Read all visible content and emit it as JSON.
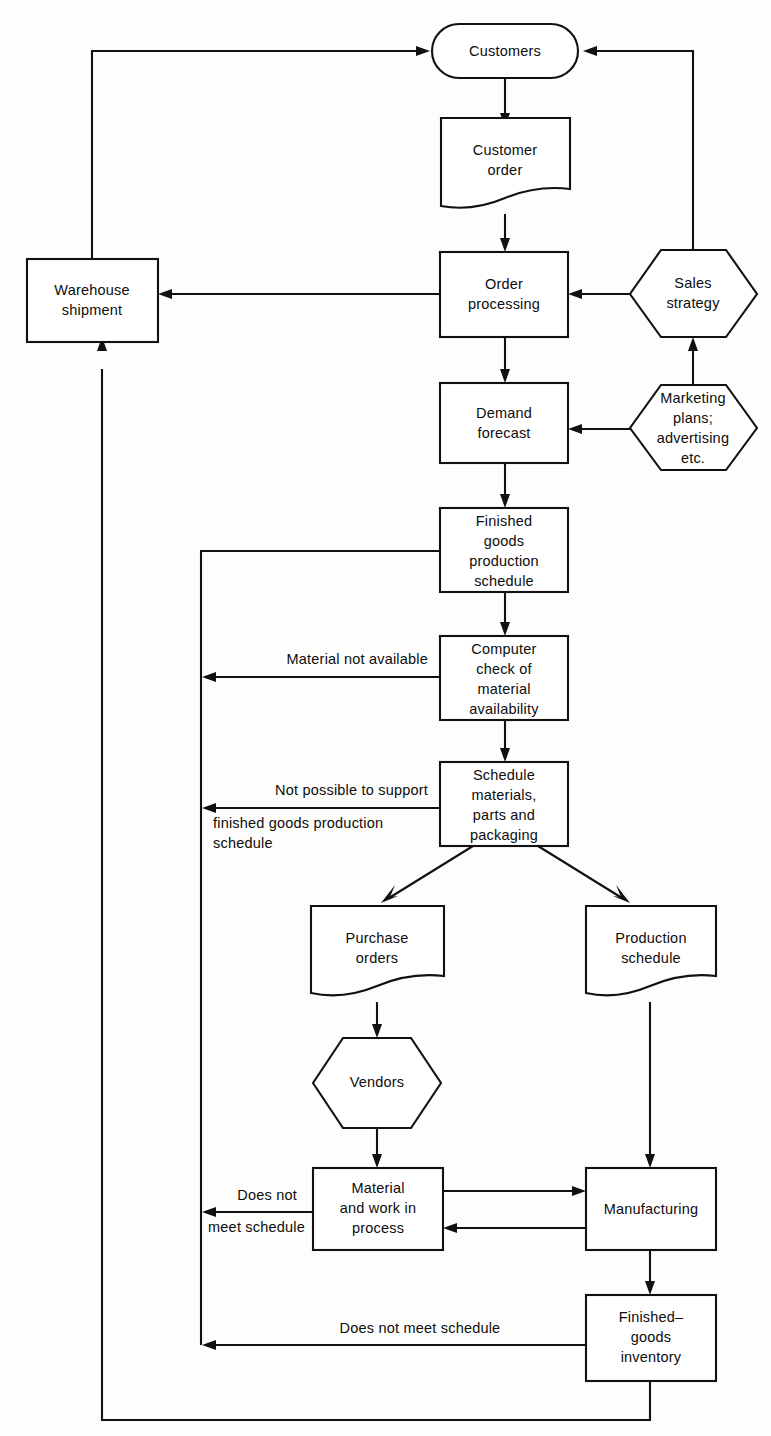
{
  "diagram": {
    "background_color": "#fdfdfb",
    "line_color": "#111111",
    "shape_fill": "#ffffff"
  },
  "nodes": {
    "customers": {
      "label": "Customers",
      "shape": "stadium"
    },
    "customer_order": {
      "label_line1": "Customer",
      "label_line2": "order",
      "shape": "document"
    },
    "order_processing": {
      "label_line1": "Order",
      "label_line2": "processing",
      "shape": "rect"
    },
    "sales_strategy": {
      "label_line1": "Sales",
      "label_line2": "strategy",
      "shape": "hexagon"
    },
    "warehouse_shipment": {
      "label_line1": "Warehouse",
      "label_line2": "shipment",
      "shape": "rect"
    },
    "demand_forecast": {
      "label_line1": "Demand",
      "label_line2": "forecast",
      "shape": "rect"
    },
    "marketing_plans": {
      "label_line1": "Marketing",
      "label_line2": "plans;",
      "label_line3": "advertising",
      "label_line4": "etc.",
      "shape": "hexagon"
    },
    "finished_goods_production_schedule": {
      "label_line1": "Finished",
      "label_line2": "goods",
      "label_line3": "production",
      "label_line4": "schedule",
      "shape": "rect"
    },
    "computer_check": {
      "label_line1": "Computer",
      "label_line2": "check of",
      "label_line3": "material",
      "label_line4": "availability",
      "shape": "rect"
    },
    "schedule_materials": {
      "label_line1": "Schedule",
      "label_line2": "materials,",
      "label_line3": "parts and",
      "label_line4": "packaging",
      "shape": "rect"
    },
    "purchase_orders": {
      "label_line1": "Purchase",
      "label_line2": "orders",
      "shape": "document"
    },
    "production_schedule": {
      "label_line1": "Production",
      "label_line2": "schedule",
      "shape": "document"
    },
    "vendors": {
      "label": "Vendors",
      "shape": "hexagon"
    },
    "material_work_in_process": {
      "label_line1": "Material",
      "label_line2": "and work in",
      "label_line3": "process",
      "shape": "rect"
    },
    "manufacturing": {
      "label": "Manufacturing",
      "shape": "rect"
    },
    "finished_goods_inventory": {
      "label_line1": "Finished–",
      "label_line2": "goods",
      "label_line3": "inventory",
      "shape": "rect"
    }
  },
  "edge_labels": {
    "material_not_available": "Material not available",
    "not_possible_line1": "Not possible to support",
    "not_possible_line2": "finished goods production",
    "not_possible_line3": "schedule",
    "does_not_line1": "Does not",
    "does_not_line2": "meet schedule",
    "does_not_meet_schedule": "Does not meet schedule"
  }
}
